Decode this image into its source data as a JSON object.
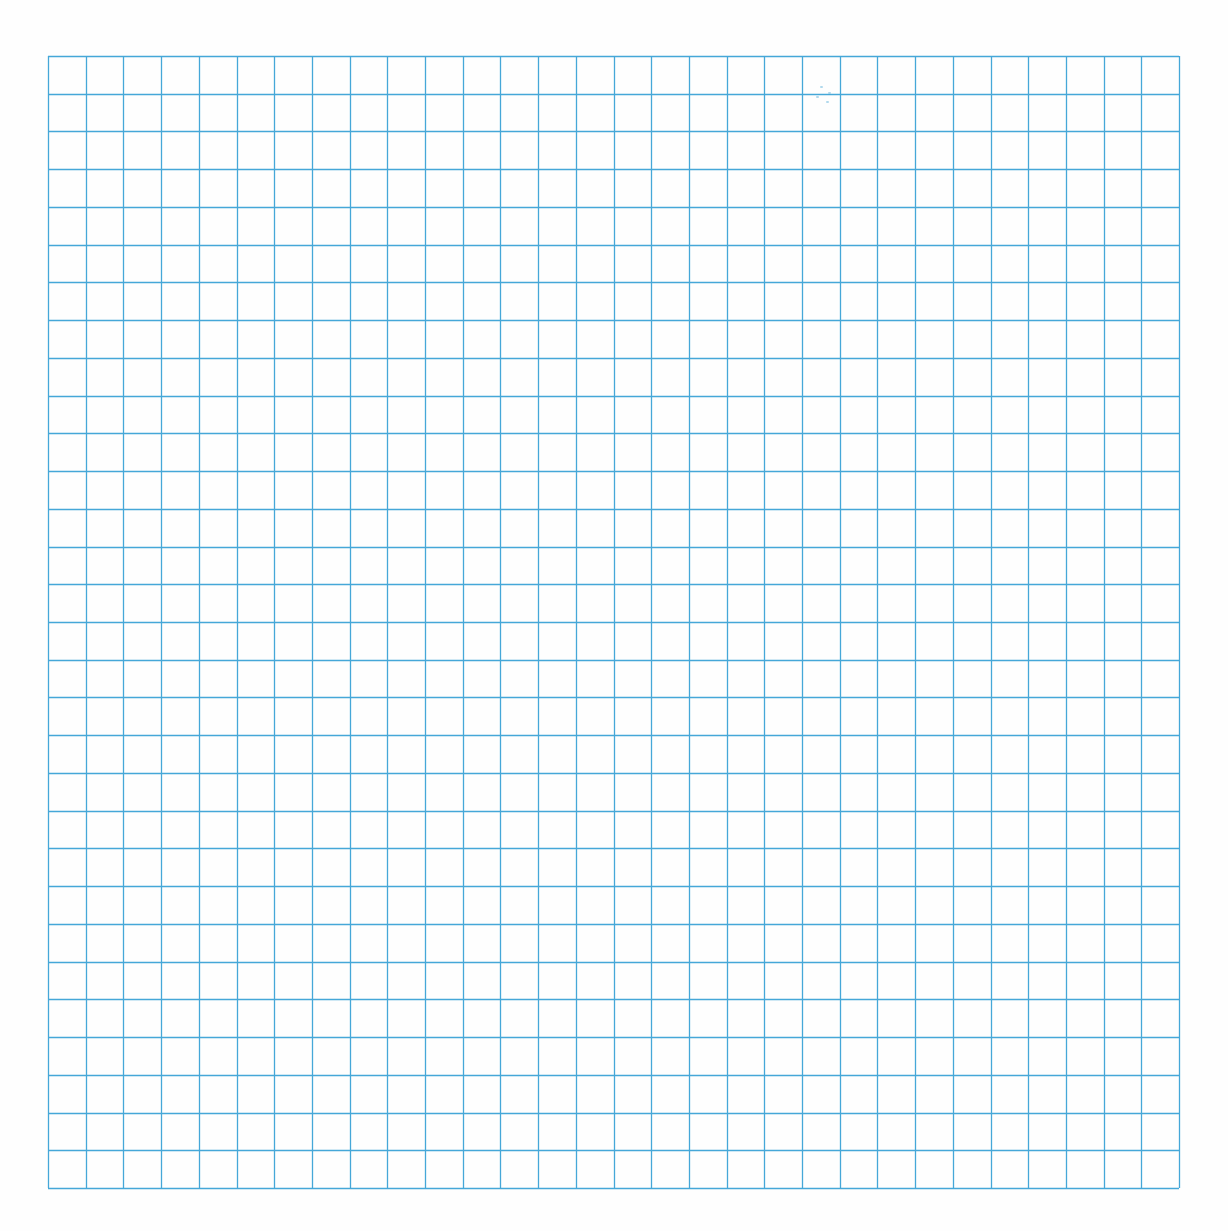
{
  "sheet": {
    "type": "graph-paper",
    "background_color": "#fefefe",
    "grid": {
      "columns": 30,
      "rows": 30,
      "line_color": "#45a7d8",
      "line_width": 1.3,
      "left": 48,
      "top": 56,
      "width": 1131,
      "height": 1132
    }
  }
}
